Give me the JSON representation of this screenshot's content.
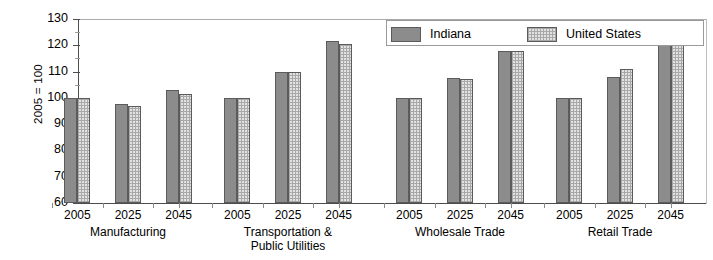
{
  "chart_data": {
    "type": "bar",
    "title": "",
    "subtitle": "",
    "xlabel": "",
    "ylabel": "2005 = 100",
    "ylim": [
      60,
      130
    ],
    "ytick_step": 10,
    "yticks": [
      60,
      70,
      80,
      90,
      100,
      110,
      120,
      130
    ],
    "minor_ticks": true,
    "grid": "top-line-only",
    "legend_position": "top-right-inside",
    "x": [
      "2005",
      "2025",
      "2045"
    ],
    "categories": [
      "2005",
      "2025",
      "2045"
    ],
    "groups": [
      {
        "label": "Manufacturing",
        "label_line1": "Manufacturing",
        "label_line2": "",
        "series": [
          {
            "name": "Indiana",
            "values": [
              100,
              97.5,
              103
            ]
          },
          {
            "name": "United States",
            "values": [
              100,
              97,
              101.5
            ]
          }
        ]
      },
      {
        "label": "Transportation & Public Utilities",
        "label_line1": "Transportation &",
        "label_line2": "Public Utilities",
        "series": [
          {
            "name": "Indiana",
            "values": [
              100,
              110,
              121.5
            ]
          },
          {
            "name": "United States",
            "values": [
              100,
              110,
              120.5
            ]
          }
        ]
      },
      {
        "label": "Wholesale Trade",
        "label_line1": "Wholesale Trade",
        "label_line2": "",
        "series": [
          {
            "name": "Indiana",
            "values": [
              100,
              107.5,
              118
            ]
          },
          {
            "name": "United States",
            "values": [
              100,
              107,
              118
            ]
          }
        ]
      },
      {
        "label": "Retail Trade",
        "label_line1": "Retail Trade",
        "label_line2": "",
        "series": [
          {
            "name": "Indiana",
            "values": [
              100,
              108,
              120
            ]
          },
          {
            "name": "United States",
            "values": [
              100,
              111,
              124
            ]
          }
        ]
      }
    ],
    "series_names": [
      "Indiana",
      "United States"
    ],
    "series_colors": [
      "#8c8c8c",
      "#e2e2e2"
    ]
  },
  "legend": {
    "items": [
      {
        "label": "Indiana",
        "swatch": "indiana",
        "color": "#8c8c8c"
      },
      {
        "label": "United States",
        "swatch": "us",
        "color": "#e2e2e2"
      }
    ]
  },
  "axis": {
    "y_title": "2005 = 100",
    "y_labels": [
      "130",
      "120",
      "110",
      "100",
      "90",
      "80",
      "70",
      "60"
    ]
  }
}
